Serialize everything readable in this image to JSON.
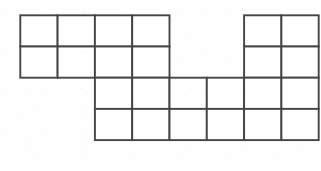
{
  "figure": {
    "type": "polyomino-grid-figure",
    "colors": {
      "line": "#454545",
      "fill": "#ffffff",
      "background": "#fefefe"
    },
    "geometry": {
      "origin_x": 20.3,
      "origin_y": 15.3,
      "cell_width": 37.3,
      "cell_height": 31.2,
      "columns": 8,
      "rows": 4
    },
    "cells": [
      {
        "col": 0,
        "row": 0,
        "name": "cell-c0-r0"
      },
      {
        "col": 1,
        "row": 0,
        "name": "cell-c1-r0"
      },
      {
        "col": 2,
        "row": 0,
        "name": "cell-c2-r0"
      },
      {
        "col": 3,
        "row": 0,
        "name": "cell-c3-r0"
      },
      {
        "col": 6,
        "row": 0,
        "name": "cell-c6-r0"
      },
      {
        "col": 7,
        "row": 0,
        "name": "cell-c7-r0"
      },
      {
        "col": 0,
        "row": 1,
        "name": "cell-c0-r1"
      },
      {
        "col": 1,
        "row": 1,
        "name": "cell-c1-r1"
      },
      {
        "col": 2,
        "row": 1,
        "name": "cell-c2-r1"
      },
      {
        "col": 3,
        "row": 1,
        "name": "cell-c3-r1"
      },
      {
        "col": 6,
        "row": 1,
        "name": "cell-c6-r1"
      },
      {
        "col": 7,
        "row": 1,
        "name": "cell-c7-r1"
      },
      {
        "col": 2,
        "row": 2,
        "name": "cell-c2-r2"
      },
      {
        "col": 3,
        "row": 2,
        "name": "cell-c3-r2"
      },
      {
        "col": 4,
        "row": 2,
        "name": "cell-c4-r2"
      },
      {
        "col": 5,
        "row": 2,
        "name": "cell-c5-r2"
      },
      {
        "col": 6,
        "row": 2,
        "name": "cell-c6-r2"
      },
      {
        "col": 7,
        "row": 2,
        "name": "cell-c7-r2"
      },
      {
        "col": 2,
        "row": 3,
        "name": "cell-c2-r3"
      },
      {
        "col": 3,
        "row": 3,
        "name": "cell-c3-r3"
      },
      {
        "col": 4,
        "row": 3,
        "name": "cell-c4-r3"
      },
      {
        "col": 5,
        "row": 3,
        "name": "cell-c5-r3"
      },
      {
        "col": 6,
        "row": 3,
        "name": "cell-c6-r3"
      },
      {
        "col": 7,
        "row": 3,
        "name": "cell-c7-r3"
      }
    ],
    "cell_count": 24,
    "blocks": [
      {
        "name": "top-left-block",
        "cols": [
          0,
          3
        ],
        "rows": [
          0,
          1
        ],
        "cell_count": 8
      },
      {
        "name": "top-right-block",
        "cols": [
          6,
          7
        ],
        "rows": [
          0,
          1
        ],
        "cell_count": 4
      },
      {
        "name": "bottom-block",
        "cols": [
          2,
          7
        ],
        "rows": [
          2,
          3
        ],
        "cell_count": 12
      }
    ]
  }
}
